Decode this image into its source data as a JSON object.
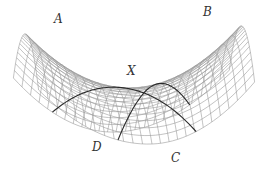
{
  "diagram": {
    "colors": {
      "mesh": "#9a9a9a",
      "curve": "#2a2a2a",
      "label": "#333333",
      "background": "#ffffff"
    },
    "labels": [
      {
        "id": "A",
        "text": "A",
        "x": 54,
        "y": 13
      },
      {
        "id": "B",
        "text": "B",
        "x": 203,
        "y": 6
      },
      {
        "id": "X",
        "text": "X",
        "x": 127,
        "y": 65
      },
      {
        "id": "D",
        "text": "D",
        "x": 92,
        "y": 141
      },
      {
        "id": "C",
        "text": "C",
        "x": 171,
        "y": 152
      }
    ],
    "mesh": {
      "u_lines": 24,
      "v_lines": 24
    }
  }
}
